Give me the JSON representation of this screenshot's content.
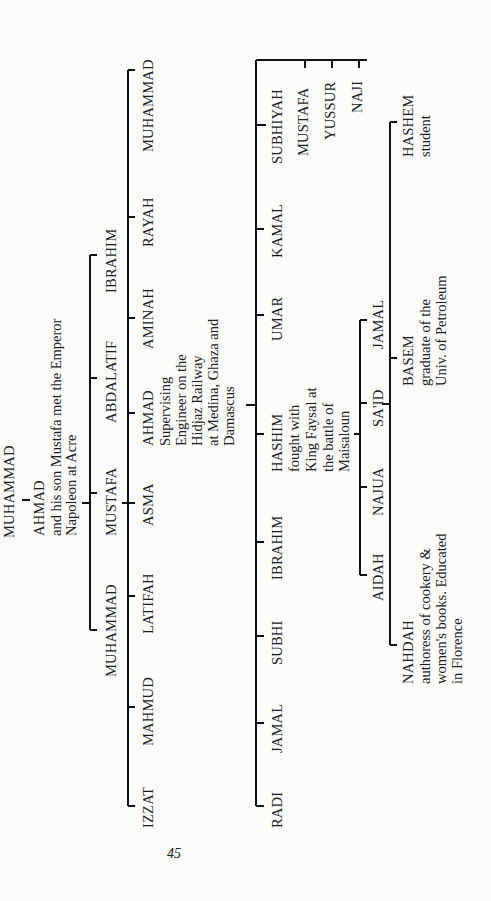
{
  "page": {
    "number": "45",
    "background": "#fbfbfa",
    "ink": "#1a1a1a"
  },
  "tree": {
    "root": "MUHAMMAD",
    "ahmad": {
      "name": "AHMAD",
      "note": [
        "and his son Mustafa met the Emperor",
        "Napoleon at Acre"
      ]
    },
    "gen2": [
      "IBRAHIM",
      "ABDALATIF",
      "MUSTAFA",
      "MUHAMMAD"
    ],
    "gen3": [
      {
        "name": "MUHAMMAD"
      },
      {
        "name": "RAYAH"
      },
      {
        "name": "AMINAH"
      },
      {
        "name": "AHMAD",
        "note": [
          "Supervising",
          "Engineer on the",
          "Hidjaz Railway",
          "at Medina, Ghaza and",
          "Damascus"
        ]
      },
      {
        "name": "ASMA"
      },
      {
        "name": "LATIFAH"
      },
      {
        "name": "MAHMUD"
      },
      {
        "name": "IZZAT"
      }
    ],
    "gen4": [
      {
        "name": "NAJI"
      },
      {
        "name": "YUSSUR"
      },
      {
        "name": "MUSTAFA"
      },
      {
        "name": "SUBHIYAH"
      },
      {
        "name": "KAMAL"
      },
      {
        "name": "UMAR"
      },
      {
        "name": "HASHIM",
        "note": [
          "fought with",
          "King Faysal at",
          "the battle of",
          "Maisaloun"
        ]
      },
      {
        "name": "IBRAHIM"
      },
      {
        "name": "SUBHI"
      },
      {
        "name": "JAMAL"
      },
      {
        "name": "RADI"
      }
    ],
    "gen5": [
      "JAMAL",
      "SA'ID",
      "NAJUA",
      "AIDAH"
    ],
    "gen6": [
      {
        "name": "HASHEM",
        "note": [
          "student"
        ]
      },
      {
        "name": "BASEM",
        "note": [
          "graduate of the",
          "Univ. of Petroleum"
        ]
      },
      {
        "name": "NAHDAH",
        "note": [
          "authoress of cookery &",
          "women's books.  Educated",
          "in Florence"
        ]
      }
    ]
  }
}
